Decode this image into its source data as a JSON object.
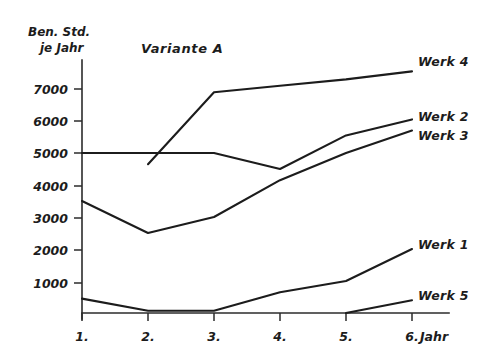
{
  "chart_data": {
    "type": "line",
    "title": "Variante A",
    "ylabel_line1": "Ben. Std.",
    "ylabel_line2": "je Jahr",
    "xlabel": "Jahr",
    "grid": false,
    "legend_position": "right-inline",
    "categories": [
      "1.",
      "2.",
      "3.",
      "4.",
      "5.",
      "6."
    ],
    "x": [
      1,
      2,
      3,
      4,
      5,
      6
    ],
    "xlim": [
      1,
      6
    ],
    "ylim": [
      0,
      7600
    ],
    "yticks": [
      1000,
      2000,
      3000,
      4000,
      5000,
      6000,
      7000
    ],
    "ytick_labels": [
      "1000",
      "2000",
      "3000",
      "4000",
      "5000",
      "6000",
      "7000"
    ],
    "series": [
      {
        "name": "Werk 4",
        "label": "Werk 4",
        "x": [
          2,
          3,
          4,
          5,
          6
        ],
        "values": [
          4650,
          6900,
          7100,
          7300,
          7550
        ]
      },
      {
        "name": "Werk 2",
        "label": "Werk 2",
        "x": [
          1,
          2,
          3,
          4,
          5,
          6
        ],
        "values": [
          5000,
          5000,
          5000,
          4500,
          5550,
          6050
        ]
      },
      {
        "name": "Werk 3",
        "label": "Werk 3",
        "x": [
          1,
          2,
          3,
          4,
          5,
          6
        ],
        "values": [
          3500,
          2500,
          3000,
          4150,
          5000,
          5700
        ]
      },
      {
        "name": "Werk 1",
        "label": "Werk 1",
        "x": [
          1,
          2,
          3,
          4,
          5,
          6
        ],
        "values": [
          450,
          70,
          70,
          650,
          1000,
          2000
        ]
      },
      {
        "name": "Werk 5",
        "label": "Werk 5",
        "x": [
          5,
          6
        ],
        "values": [
          0,
          400
        ]
      }
    ]
  }
}
